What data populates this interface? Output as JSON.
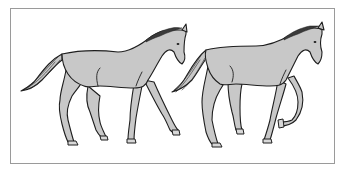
{
  "illustration": {
    "description": "Two gray horses walking to the right, line-art illustration in a thin frame",
    "colors": {
      "background": "#ffffff",
      "frame": "#9a9a9a",
      "horse_fill": "#c8c8c8",
      "outline": "#1e1e1e"
    },
    "horses": [
      {
        "id": "horse-left",
        "gait": "walk"
      },
      {
        "id": "horse-right",
        "gait": "walk"
      }
    ]
  }
}
